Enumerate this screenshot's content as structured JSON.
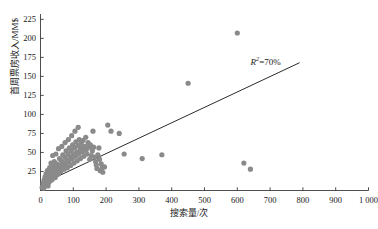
{
  "chart_data": {
    "type": "scatter",
    "title": "",
    "subtitle": "",
    "xlabel": "搜索量/次",
    "ylabel": "首周票房收入/MM$",
    "xlim": [
      0,
      1000
    ],
    "ylim": [
      0,
      232
    ],
    "xticks": [
      0,
      100,
      200,
      300,
      400,
      500,
      600,
      700,
      800,
      900,
      1000
    ],
    "xtick_labels": [
      "0",
      "100",
      "200",
      "300",
      "400",
      "500",
      "600",
      "700",
      "800",
      "900",
      "1 000"
    ],
    "yticks": [
      0,
      25,
      50,
      75,
      100,
      125,
      150,
      175,
      200,
      225
    ],
    "ytick_labels": [
      "0",
      "25",
      "50",
      "75",
      "100",
      "125",
      "150",
      "175",
      "200",
      "225"
    ],
    "grid": false,
    "legend": null,
    "point_color": "#8a8a8a",
    "point_size": 2.6,
    "line_color": "#2b2b2b",
    "annotations": [
      {
        "name": "r-squared-annotation",
        "prefix": "R",
        "exponent": "2",
        "equals": "=",
        "value": "70%",
        "x": 640,
        "y": 170
      }
    ],
    "trendline": {
      "type": "linear",
      "x_start": 0,
      "y_start": 8,
      "x_end": 790,
      "y_end": 168,
      "r_squared": 0.7
    },
    "points": [
      [
        5,
        4
      ],
      [
        7,
        6
      ],
      [
        8,
        10
      ],
      [
        9,
        3
      ],
      [
        10,
        8
      ],
      [
        11,
        14
      ],
      [
        12,
        5
      ],
      [
        13,
        11
      ],
      [
        14,
        18
      ],
      [
        15,
        7
      ],
      [
        16,
        13
      ],
      [
        17,
        22
      ],
      [
        18,
        9
      ],
      [
        19,
        16
      ],
      [
        20,
        12
      ],
      [
        21,
        26
      ],
      [
        22,
        20
      ],
      [
        23,
        6
      ],
      [
        24,
        15
      ],
      [
        25,
        24
      ],
      [
        26,
        11
      ],
      [
        27,
        19
      ],
      [
        28,
        30
      ],
      [
        29,
        13
      ],
      [
        30,
        23
      ],
      [
        31,
        17
      ],
      [
        32,
        36
      ],
      [
        33,
        21
      ],
      [
        34,
        27
      ],
      [
        35,
        14
      ],
      [
        36,
        25
      ],
      [
        37,
        46
      ],
      [
        38,
        31
      ],
      [
        39,
        19
      ],
      [
        40,
        28
      ],
      [
        41,
        22
      ],
      [
        42,
        38
      ],
      [
        43,
        24
      ],
      [
        44,
        33
      ],
      [
        45,
        17
      ],
      [
        46,
        29
      ],
      [
        47,
        48
      ],
      [
        48,
        26
      ],
      [
        50,
        35
      ],
      [
        52,
        21
      ],
      [
        54,
        30
      ],
      [
        55,
        55
      ],
      [
        57,
        27
      ],
      [
        58,
        42
      ],
      [
        60,
        33
      ],
      [
        62,
        25
      ],
      [
        64,
        39
      ],
      [
        65,
        58
      ],
      [
        67,
        31
      ],
      [
        68,
        47
      ],
      [
        70,
        36
      ],
      [
        72,
        28
      ],
      [
        74,
        44
      ],
      [
        75,
        63
      ],
      [
        77,
        34
      ],
      [
        78,
        52
      ],
      [
        80,
        40
      ],
      [
        82,
        30
      ],
      [
        84,
        48
      ],
      [
        85,
        67
      ],
      [
        87,
        38
      ],
      [
        88,
        56
      ],
      [
        90,
        44
      ],
      [
        92,
        33
      ],
      [
        94,
        52
      ],
      [
        95,
        72
      ],
      [
        97,
        42
      ],
      [
        98,
        60
      ],
      [
        100,
        47
      ],
      [
        102,
        36
      ],
      [
        104,
        56
      ],
      [
        105,
        78
      ],
      [
        107,
        45
      ],
      [
        108,
        64
      ],
      [
        110,
        50
      ],
      [
        112,
        39
      ],
      [
        114,
        59
      ],
      [
        115,
        83
      ],
      [
        117,
        48
      ],
      [
        118,
        67
      ],
      [
        120,
        53
      ],
      [
        122,
        42
      ],
      [
        124,
        62
      ],
      [
        125,
        56
      ],
      [
        128,
        51
      ],
      [
        130,
        66
      ],
      [
        132,
        45
      ],
      [
        135,
        58
      ],
      [
        138,
        70
      ],
      [
        140,
        54
      ],
      [
        142,
        48
      ],
      [
        145,
        63
      ],
      [
        148,
        57
      ],
      [
        150,
        41
      ],
      [
        152,
        60
      ],
      [
        155,
        46
      ],
      [
        158,
        52
      ],
      [
        160,
        78
      ],
      [
        162,
        57
      ],
      [
        165,
        44
      ],
      [
        168,
        38
      ],
      [
        170,
        34
      ],
      [
        172,
        29
      ],
      [
        175,
        47
      ],
      [
        178,
        56
      ],
      [
        180,
        41
      ],
      [
        182,
        26
      ],
      [
        185,
        35
      ],
      [
        188,
        30
      ],
      [
        190,
        24
      ],
      [
        195,
        31
      ],
      [
        205,
        86
      ],
      [
        215,
        78
      ],
      [
        240,
        75
      ],
      [
        255,
        48
      ],
      [
        310,
        42
      ],
      [
        370,
        47
      ],
      [
        450,
        141
      ],
      [
        600,
        207
      ],
      [
        620,
        36
      ],
      [
        640,
        28
      ]
    ]
  }
}
